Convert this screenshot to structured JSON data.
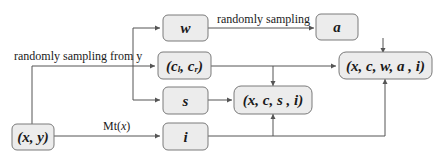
{
  "diagram": {
    "nodes": {
      "xy": "(x, y)",
      "w": "w",
      "c": "(c",
      "c_l_sub": "l",
      "c_mid": ", c",
      "c_r_sub": "r",
      "c_end": ")",
      "s": "s",
      "i": "i",
      "a": "a",
      "xcsi": "(x, c, s , i)",
      "xcwai": "(x, c, w, a , i)"
    },
    "edge_labels": {
      "sampling_from_y": "randomly sampling from y",
      "randomly_sampling": "randomly sampling",
      "mt_prefix": "Mt(",
      "mt_var": "x",
      "mt_suffix": ")"
    },
    "colors": {
      "node_fill": "#ececec",
      "node_stroke": "#7a7a7a",
      "edge": "#555555",
      "text": "#1a1a1a"
    }
  }
}
